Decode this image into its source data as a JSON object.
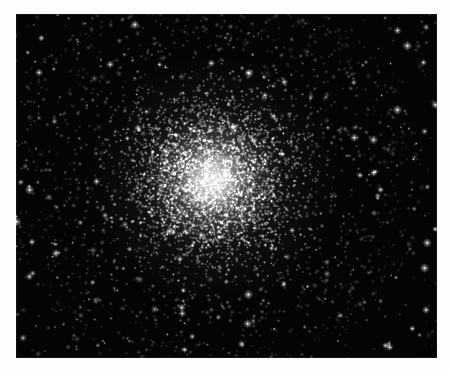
{
  "image": {
    "kind": "astrophotograph",
    "subject": "globular-star-cluster",
    "caption": "",
    "background_color": "#040404",
    "core_color": "#ffffff",
    "halo_color": "#d8d8d4",
    "page_color": "#ffffff",
    "frame": {
      "x": 16,
      "y": 14,
      "width": 421,
      "height": 344
    }
  },
  "cluster": {
    "center_x": 196,
    "center_y": 166,
    "core_radius": 34,
    "halo_radius": 128,
    "outskirts_radius": 210,
    "total_star_count": 5200,
    "field_star_count": 700,
    "brightness_peak": 1.0
  },
  "render": {
    "seed": 20240517,
    "core_star_count": 3400,
    "halo_star_count": 1100,
    "min_star_radius": 0.35,
    "max_star_radius": 1.5
  }
}
